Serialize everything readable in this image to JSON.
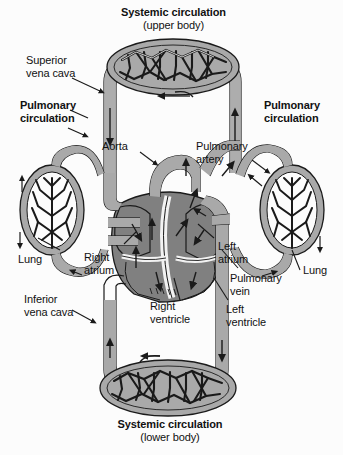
{
  "figure": {
    "title_top": "Systemic circulation",
    "subtitle_top": "(upper body)",
    "title_bottom": "Systemic circulation",
    "subtitle_bottom": "(lower body)",
    "background_color": "#fcfcfc",
    "vessel_color": "#a9a9a9",
    "chamber_color": "#808080",
    "outline_color": "#1a1a1a",
    "label_color": "#111111"
  },
  "labels": {
    "systemic_upper_line1": "Systemic circulation",
    "systemic_upper_line2": "(upper body)",
    "systemic_lower_line1": "Systemic circulation",
    "systemic_lower_line2": "(lower body)",
    "superior_vena_cava_line1": "Superior",
    "superior_vena_cava_line2": "vena cava",
    "inferior_vena_cava_line1": "Inferior",
    "inferior_vena_cava_line2": "vena cava",
    "pulmonary_circulation_left_line1": "Pulmonary",
    "pulmonary_circulation_left_line2": "circulation",
    "pulmonary_circulation_right_line1": "Pulmonary",
    "pulmonary_circulation_right_line2": "circulation",
    "aorta": "Aorta",
    "pulmonary_artery_line1": "Pulmonary",
    "pulmonary_artery_line2": "artery",
    "pulmonary_vein_line1": "Pulmonary",
    "pulmonary_vein_line2": "vein",
    "lung_left": "Lung",
    "lung_right": "Lung",
    "right_atrium_line1": "Right",
    "right_atrium_line2": "atrium",
    "left_atrium_line1": "Left",
    "left_atrium_line2": "atrium",
    "right_ventricle_line1": "Right",
    "right_ventricle_line2": "ventricle",
    "left_ventricle_line1": "Left",
    "left_ventricle_line2": "ventricle"
  },
  "icons": {
    "flow_arrow": "flow-arrow-icon",
    "leader_line": "leader-line-icon",
    "capillary_bed": "capillary-bed-icon",
    "lung": "lung-icon",
    "heart": "heart-icon"
  }
}
